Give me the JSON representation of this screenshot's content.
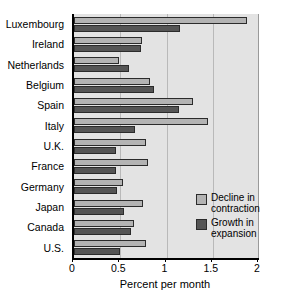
{
  "chart_data": {
    "type": "bar",
    "orientation": "horizontal",
    "title": "",
    "xlabel": "Percent per month",
    "ylabel": "",
    "xlim": [
      0,
      2
    ],
    "xticks": [
      0,
      0.5,
      1,
      1.5,
      2
    ],
    "xtick_labels": [
      "0",
      "0.5",
      "1",
      "1.5",
      "2"
    ],
    "grid": true,
    "grid_axis": "x",
    "legend_position": "lower right",
    "categories": [
      "Luxembourg",
      "Ireland",
      "Netherlands",
      "Belgium",
      "Spain",
      "Italy",
      "U.K.",
      "France",
      "Germany",
      "Japan",
      "Canada",
      "U.S."
    ],
    "series": [
      {
        "name": "Decline in contraction",
        "color": "#b3b3b3",
        "values": [
          1.87,
          0.73,
          0.49,
          0.82,
          1.29,
          1.45,
          0.78,
          0.8,
          0.53,
          0.75,
          0.65,
          0.78
        ]
      },
      {
        "name": "Growth in expansion",
        "color": "#555555",
        "values": [
          1.15,
          0.72,
          0.59,
          0.87,
          1.14,
          0.66,
          0.45,
          0.45,
          0.47,
          0.54,
          0.62,
          0.5
        ]
      }
    ]
  },
  "legend": {
    "entries": [
      {
        "label": "Decline in\ncontraction",
        "swatch": "decline-swatch"
      },
      {
        "label": "Growth in\nexpansion",
        "swatch": "growth-swatch"
      }
    ]
  }
}
